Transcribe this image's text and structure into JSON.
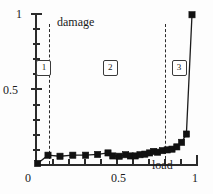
{
  "chart_data": {
    "type": "line",
    "title": "",
    "xlabel": "load",
    "ylabel": "damage",
    "xlim": [
      0,
      1
    ],
    "ylim": [
      0,
      1
    ],
    "grid": false,
    "legend": null,
    "x_ticks": [
      0,
      0.1,
      0.2,
      0.3,
      0.4,
      0.5,
      0.6,
      0.7,
      0.8,
      0.9,
      1
    ],
    "x_tick_labels": [
      "0",
      "",
      "",
      "",
      "",
      "0.5",
      "",
      "",
      "",
      "",
      "1"
    ],
    "y_ticks": [
      0,
      0.1,
      0.2,
      0.3,
      0.4,
      0.5,
      0.6,
      0.7,
      0.8,
      0.9,
      1
    ],
    "y_tick_labels": [
      "",
      "",
      "",
      "",
      "",
      "0.5",
      "",
      "",
      "",
      "",
      "1"
    ],
    "marker": "filled-square",
    "series": [
      {
        "name": "damage vs load",
        "x": [
          0.01,
          0.075,
          0.15,
          0.23,
          0.31,
          0.385,
          0.45,
          0.48,
          0.52,
          0.56,
          0.59,
          0.62,
          0.65,
          0.68,
          0.71,
          0.735,
          0.76,
          0.79,
          0.82,
          0.85,
          0.88,
          0.91,
          0.94,
          0.975
        ],
        "y": [
          0.01,
          0.065,
          0.058,
          0.065,
          0.065,
          0.07,
          0.08,
          0.06,
          0.058,
          0.068,
          0.06,
          0.06,
          0.068,
          0.072,
          0.08,
          0.09,
          0.085,
          0.095,
          0.1,
          0.105,
          0.12,
          0.15,
          0.205,
          0.995
        ]
      }
    ],
    "annotations": {
      "region_dividers_x": [
        0.08,
        0.805
      ],
      "regions": [
        {
          "id": "1",
          "label": "1",
          "x": 0.04,
          "y": 0.66
        },
        {
          "id": "2",
          "label": "2",
          "x": 0.455,
          "y": 0.66
        },
        {
          "id": "3",
          "label": "3",
          "x": 0.885,
          "y": 0.66
        }
      ]
    },
    "colors": {
      "axis": "#2b2b2b",
      "line": "#1c1c1c",
      "marker": "#111111",
      "divider": "#2b2b2b",
      "background": "#fdfdfd"
    }
  },
  "labels": {
    "y_axis_name": "damage",
    "x_axis_name": "load",
    "y_top": "1",
    "y_mid": "0.5",
    "x_left": "0",
    "x_mid": "0.5",
    "x_right": "1",
    "region_1": "1",
    "region_2": "2",
    "region_3": "3"
  }
}
